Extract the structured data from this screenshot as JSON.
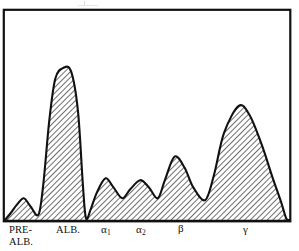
{
  "figure": {
    "kind": "densitometry-tracing",
    "frame": {
      "stroke_color": "#111111",
      "fill_color": "#ffffff",
      "x": 3,
      "y": 9,
      "width": 288,
      "height": 213
    },
    "curve": {
      "stroke_color": "#111111",
      "fill_color": "#b3b3b3",
      "hatch_color": "#4d4d4d",
      "stroke_width": 2.1,
      "hatch_angle_deg": 45,
      "baseline_y": 220
    },
    "artifact": {
      "name": "scan-speck",
      "visible": true
    }
  },
  "axis_labels": [
    {
      "id": "pre-alb",
      "line1": "PRE-",
      "line2": "ALB."
    },
    {
      "id": "alb",
      "line1": "ALB.",
      "line2": ""
    },
    {
      "id": "alpha1",
      "greek": "α",
      "sub": "1"
    },
    {
      "id": "alpha2",
      "greek": "α",
      "sub": "2"
    },
    {
      "id": "beta",
      "greek": "β",
      "sub": ""
    },
    {
      "id": "gamma",
      "greek": "γ",
      "sub": ""
    }
  ],
  "chart_data": {
    "type": "line",
    "title": "",
    "subtitle": "",
    "xlabel": "",
    "ylabel": "",
    "grid": false,
    "legend": "none",
    "axis_tick_labels": [
      "PRE-ALB.",
      "ALB.",
      "α1",
      "α2",
      "β",
      "γ"
    ],
    "xlim": [
      0,
      100
    ],
    "ylim": [
      0,
      100
    ],
    "note_shading": "area under curve filled with diagonal hatch",
    "fractions": [
      {
        "name": "PRE-ALB.",
        "x_pct": 6.6,
        "peak_height_pct": 12
      },
      {
        "name": "ALB.",
        "x_pct": 20.5,
        "peak_height_pct": 84
      },
      {
        "name": "α1",
        "x_pct": 35.4,
        "peak_height_pct": 23
      },
      {
        "name": "α2",
        "x_pct": 47.6,
        "peak_height_pct": 22
      },
      {
        "name": "β",
        "x_pct": 59.7,
        "peak_height_pct": 35
      },
      {
        "name": "γ",
        "x_pct": 82.3,
        "peak_height_pct": 63
      }
    ],
    "valleys": [
      {
        "x_pct": 11.8,
        "height_pct": 3
      },
      {
        "x_pct": 28.5,
        "height_pct": 1
      },
      {
        "x_pct": 41.3,
        "height_pct": 12
      },
      {
        "x_pct": 53.8,
        "height_pct": 12
      },
      {
        "x_pct": 70.5,
        "height_pct": 11
      },
      {
        "x_pct": 99.0,
        "height_pct": 1
      }
    ],
    "x": [
      0.0,
      2.1,
      4.2,
      6.6,
      9.0,
      11.8,
      13.5,
      15.6,
      17.7,
      20.5,
      23.3,
      25.7,
      27.4,
      28.5,
      30.2,
      32.3,
      35.4,
      38.2,
      41.3,
      44.1,
      47.6,
      50.7,
      53.8,
      56.3,
      59.7,
      63.2,
      66.3,
      70.5,
      73.6,
      77.1,
      82.3,
      86.1,
      90.3,
      94.1,
      97.2,
      99.0,
      100.0
    ],
    "y": [
      0.0,
      4.0,
      8.5,
      12.0,
      7.5,
      3.0,
      20.0,
      55.0,
      78.0,
      84.0,
      82.0,
      60.0,
      20.0,
      1.0,
      6.0,
      15.0,
      23.0,
      18.0,
      12.0,
      17.0,
      22.0,
      18.0,
      12.0,
      22.0,
      35.0,
      29.0,
      18.0,
      11.0,
      25.0,
      48.0,
      63.0,
      58.0,
      42.0,
      24.0,
      10.0,
      1.0,
      0.0
    ]
  }
}
